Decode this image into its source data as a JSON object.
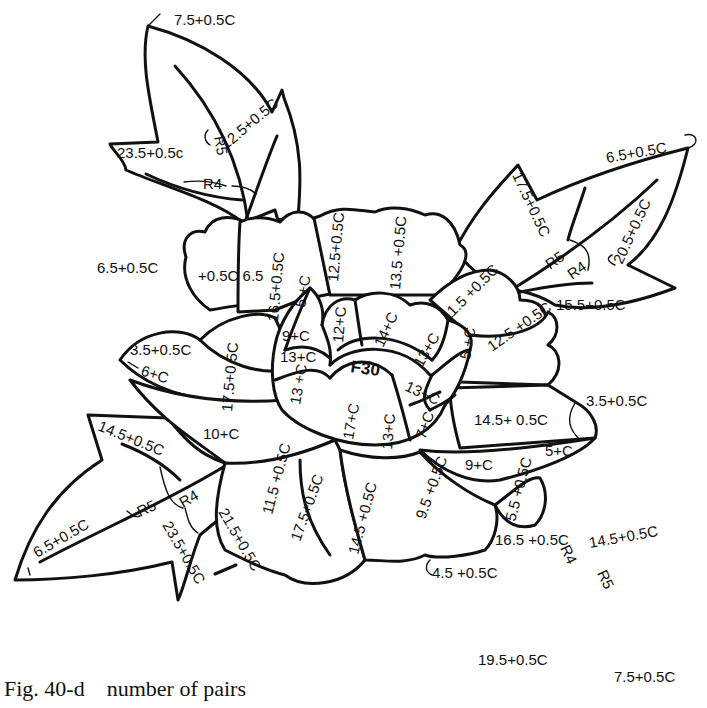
{
  "figure": {
    "caption": "Fig. 40-d    number of pairs",
    "center_label": "F30",
    "colors": {
      "line": "#111111",
      "background": "#ffffff"
    }
  },
  "leaves": {
    "top_left": {
      "tip": "7.5+0.5C",
      "left_lobe": "23.5+0.5c",
      "right_lobe": "12.5+0.5C",
      "r5": "R5",
      "r4": "R4",
      "base": "6.5+0.5C"
    },
    "top_right": {
      "tip": "6.5+0.5C",
      "upper_lobe": "17.5+0.5C",
      "lower_right": "20.5+0.5C",
      "bottom": "15.5+0.5C",
      "r5": "R5",
      "r4": "R4"
    },
    "bottom_left": {
      "upper": "14.5+0.5C",
      "tip": "6.5+0.5C",
      "r5": "R5",
      "r4": "R4",
      "lower": "23.5+0.5C",
      "stem": "21.5+0.5C"
    },
    "bottom_right": {
      "upper": "14.5+0.5C",
      "left_lobe": "16.5 +0.5C",
      "r4": "R4",
      "r5": "R5",
      "tip_left": "19.5+0.5C",
      "tip_right": "7.5+0.5C"
    }
  },
  "petals": {
    "outer": [
      {
        "id": "p-top-left-small",
        "text": "+0.5C 6.5"
      },
      {
        "id": "p-top-left",
        "text": "16.5+0.5C"
      },
      {
        "id": "p-top-stem",
        "text": "12.5+0.5C"
      },
      {
        "id": "p-top",
        "text": "13.5 +0.5C"
      },
      {
        "id": "p-top-right",
        "text": "11.5 +0.5C"
      },
      {
        "id": "p-right",
        "text": "12.5 +0.5C"
      },
      {
        "id": "p-left-tip",
        "text": "3.5+0.5C"
      },
      {
        "id": "p-left-inner",
        "text": "6+C"
      },
      {
        "id": "p-left",
        "text": "17.5+0.5C"
      },
      {
        "id": "p-left-lower",
        "text": "10+C"
      },
      {
        "id": "p-right-lower",
        "text": "14.5+ 0.5C"
      },
      {
        "id": "p-right-tip",
        "text": "3.5+0.5C"
      },
      {
        "id": "p-right-small",
        "text": "5+C"
      },
      {
        "id": "p-right-band",
        "text": "9+C"
      },
      {
        "id": "p-bottom-left-a",
        "text": "11.5 +0.5C"
      },
      {
        "id": "p-bottom-left-b",
        "text": "17.5+0.5C"
      },
      {
        "id": "p-bottom",
        "text": "14.5 +0.5C"
      },
      {
        "id": "p-bottom-right",
        "text": "9.5 +0.5C"
      },
      {
        "id": "p-bottom-right-small",
        "text": "5.5 +0.5C"
      },
      {
        "id": "p-bottom-tip",
        "text": "4.5 +0.5C"
      }
    ],
    "inner": [
      {
        "id": "i-5c-left",
        "text": "5 +C"
      },
      {
        "id": "i-9c",
        "text": "9+C"
      },
      {
        "id": "i-13c-left",
        "text": "13+C"
      },
      {
        "id": "i-12c",
        "text": "12+C"
      },
      {
        "id": "i-14c",
        "text": "14+C"
      },
      {
        "id": "i-13c-right-top",
        "text": "13+C"
      },
      {
        "id": "i-5c-right",
        "text": "5 +C"
      },
      {
        "id": "i-13c-right",
        "text": "13+C"
      },
      {
        "id": "i-13c-lower-left",
        "text": "13 +C"
      },
      {
        "id": "i-17c",
        "text": "17+C"
      },
      {
        "id": "i-13c-center",
        "text": "13+C"
      },
      {
        "id": "i-7c",
        "text": "7+C"
      }
    ]
  }
}
